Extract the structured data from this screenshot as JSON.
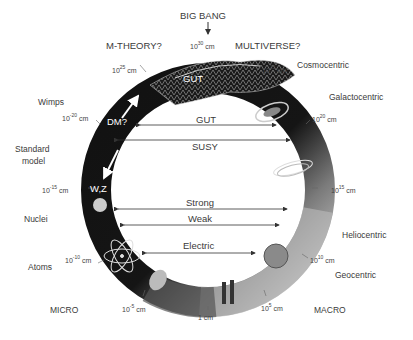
{
  "diagram": {
    "top_labels": {
      "big_bang": "BIG BANG",
      "m_theory": "M-THEORY?",
      "multiverse": "MULTIVERSE?"
    },
    "side_labels": {
      "left": [
        "Wimps",
        "Standard model",
        "Nuclei",
        "Atoms",
        "MICRO"
      ],
      "right": [
        "Cosmocentric",
        "Galactocentric",
        "Heliocentric",
        "Geocentric",
        "MACRO"
      ]
    },
    "labels": {
      "wimps": "Wimps",
      "standard_model_1": "Standard",
      "standard_model_2": "model",
      "nuclei": "Nuclei",
      "atoms": "Atoms",
      "micro": "MICRO",
      "cosmocentric": "Cosmocentric",
      "galactocentric": "Galactocentric",
      "heliocentric": "Heliocentric",
      "geocentric": "Geocentric",
      "macro": "MACRO"
    },
    "scales": {
      "top": {
        "base": "10",
        "exp": "30",
        "unit": " cm"
      },
      "upper_left": {
        "base": "10",
        "exp": "25",
        "unit": " cm"
      },
      "upper_right": {
        "base": "10",
        "exp": "25",
        "unit": " cm"
      },
      "left_20": {
        "base": "10",
        "exp": "-20",
        "unit": " cm"
      },
      "right_20": {
        "base": "10",
        "exp": "20",
        "unit": " cm"
      },
      "left_15": {
        "base": "10",
        "exp": "-15",
        "unit": " cm"
      },
      "right_15": {
        "base": "10",
        "exp": "15",
        "unit": " cm"
      },
      "left_10": {
        "base": "10",
        "exp": "-10",
        "unit": " cm"
      },
      "right_10": {
        "base": "10",
        "exp": "10",
        "unit": " cm"
      },
      "left_5": {
        "base": "10",
        "exp": "-5",
        "unit": " cm"
      },
      "right_5": {
        "base": "10",
        "exp": "5",
        "unit": " cm"
      },
      "bottom": {
        "base": "",
        "exp": "",
        "unit": "1 cm"
      }
    },
    "ring_text": {
      "gut": "GUT",
      "dm": "DM?",
      "wz": "W,Z"
    },
    "forces": {
      "gut": "GUT",
      "susy": "SUSY",
      "strong": "Strong",
      "weak": "Weak",
      "electric": "Electric"
    },
    "colors": {
      "ring_dark": "#141414",
      "ring_mid": "#6e6e6e",
      "ring_light": "#cfcfcf",
      "arrow": "#333333",
      "text": "#3a3a3a"
    }
  }
}
